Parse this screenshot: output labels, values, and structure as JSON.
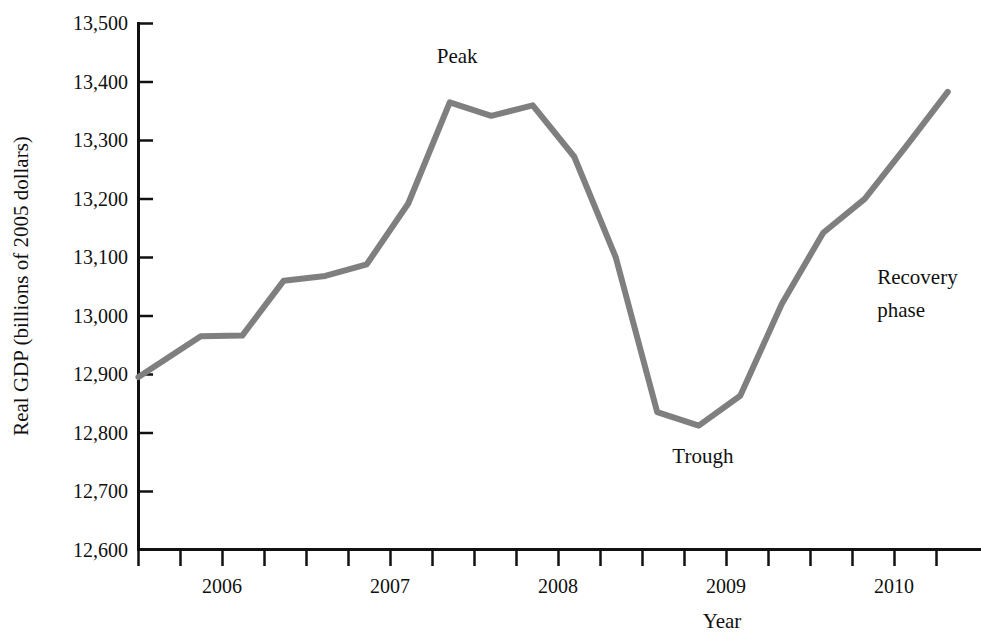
{
  "chart_data": {
    "type": "line",
    "title": "",
    "xlabel": "Year",
    "ylabel": "Real GDP (billions of 2005 dollars)",
    "ylim": [
      12600,
      13500
    ],
    "xlim": [
      2005.5,
      2010.5
    ],
    "ytick_labels": [
      "13,500",
      "13,400",
      "13,300",
      "13,200",
      "13,100",
      "13,000",
      "12,900",
      "12,800",
      "12,700",
      "12,600"
    ],
    "ytick_values": [
      13500,
      13400,
      13300,
      13200,
      13100,
      13000,
      12900,
      12800,
      12700,
      12600
    ],
    "xtick_labels": [
      "2006",
      "2007",
      "2008",
      "2009",
      "2010"
    ],
    "xtick_values": [
      2006,
      2007,
      2008,
      2009,
      2010
    ],
    "minor_tick_interval_years": 0.25,
    "grid": false,
    "legend": "none",
    "line_color": "#7f7f7f",
    "line_width_px": 6,
    "series": [
      {
        "name": "Real GDP",
        "x": [
          2005.5,
          2005.875,
          2006.125,
          2006.375,
          2006.625,
          2006.875,
          2007.125,
          2007.375,
          2007.625,
          2007.875,
          2008.125,
          2008.375,
          2008.625,
          2008.875,
          2009.125,
          2009.375,
          2009.625,
          2009.875,
          2010.125,
          2010.375
        ],
        "y": [
          12895,
          12965,
          12966,
          13060,
          13068,
          13088,
          13192,
          13365,
          13342,
          13360,
          13272,
          13100,
          12835,
          12812,
          12863,
          13020,
          13142,
          13200,
          13290,
          13383
        ]
      }
    ],
    "annotations": [
      {
        "text": "Peak",
        "x": 2007.42,
        "y": 13432,
        "label": "peak"
      },
      {
        "text": "Trough",
        "x": 2008.9,
        "y": 12748,
        "label": "trough"
      },
      {
        "text": "Recovery",
        "x": 2009.95,
        "y": 13054,
        "label": "recovery-line-1"
      },
      {
        "text": "phase",
        "x": 2009.95,
        "y": 12998,
        "label": "recovery-line-2"
      }
    ]
  }
}
